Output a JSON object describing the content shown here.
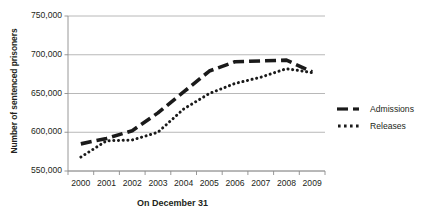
{
  "chart_data": {
    "type": "line",
    "title": "",
    "xlabel": "On December 31",
    "ylabel": "Number of sentenced prisoners",
    "categories": [
      "2000",
      "2001",
      "2002",
      "2003",
      "2004",
      "2005",
      "2006",
      "2007",
      "2008",
      "2009"
    ],
    "x": [
      2000,
      2001,
      2002,
      2003,
      2004,
      2005,
      2006,
      2007,
      2008,
      2009
    ],
    "ylim": [
      550000,
      750000
    ],
    "yticks": [
      550000,
      600000,
      650000,
      700000,
      750000
    ],
    "ytick_labels": [
      "550,000",
      "600,000",
      "650,000",
      "700,000",
      "750,000"
    ],
    "grid": true,
    "legend_position": "right",
    "series": [
      {
        "name": "Admissions",
        "style": "dashed",
        "color": "#1a1a1a",
        "values": [
          585000,
          592000,
          602000,
          625000,
          652000,
          679000,
          691000,
          692000,
          693000,
          678000
        ]
      },
      {
        "name": "Releases",
        "style": "dotted",
        "color": "#1a1a1a",
        "values": [
          568000,
          589000,
          590000,
          600000,
          630000,
          650000,
          663000,
          671000,
          682000,
          677000
        ]
      }
    ]
  },
  "axis": {
    "y_title": "Number of sentenced prisoners",
    "x_title": "On December 31"
  },
  "legend": {
    "items": [
      {
        "label": "Admissions",
        "style": "dashed"
      },
      {
        "label": "Releases",
        "style": "dotted"
      }
    ]
  }
}
